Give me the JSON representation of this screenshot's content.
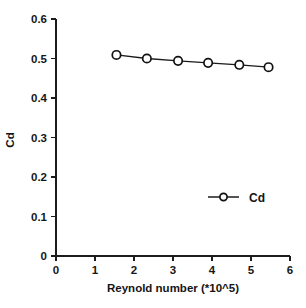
{
  "chart_data": {
    "type": "line",
    "title": "",
    "xlabel": "Reynold number (*10^5)",
    "ylabel": "Cd",
    "xlim": [
      0,
      6
    ],
    "ylim": [
      0,
      0.6
    ],
    "grid": false,
    "legend_position": "bottom-right",
    "x_ticks": [
      "0",
      "1",
      "2",
      "3",
      "4",
      "5",
      "6"
    ],
    "x_tick_values": [
      0,
      1,
      2,
      3,
      4,
      5,
      6
    ],
    "y_ticks": [
      "0",
      "0.1",
      "0.2",
      "0.3",
      "0.4",
      "0.5",
      "0.6"
    ],
    "y_tick_values": [
      0,
      0.1,
      0.2,
      0.3,
      0.4,
      0.5,
      0.6
    ],
    "marker": "open-circle",
    "series": [
      {
        "name": "Cd",
        "x": [
          1.55,
          2.33,
          3.13,
          3.9,
          4.7,
          5.45
        ],
        "values": [
          0.509,
          0.5,
          0.494,
          0.489,
          0.484,
          0.478
        ]
      }
    ]
  },
  "legend": {
    "entries": [
      {
        "label": "Cd",
        "marker": "open-circle"
      }
    ]
  },
  "axes": {
    "y_axis_label": "Cd",
    "x_axis_label": "Reynold number (*10^5)"
  }
}
